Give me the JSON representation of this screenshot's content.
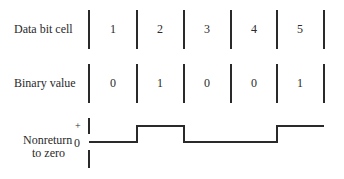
{
  "rows": {
    "data_bit_cell": {
      "label": "Data bit cell",
      "cells": [
        "1",
        "2",
        "3",
        "4",
        "5"
      ]
    },
    "binary_value": {
      "label": "Binary value",
      "values": [
        "0",
        "1",
        "0",
        "0",
        "1"
      ]
    },
    "nrz": {
      "label_line1": "Nonreturn",
      "label_line2": "to zero",
      "plus": "+",
      "zero": "0"
    }
  },
  "colors": {
    "line": "#2a2a2a",
    "text": "#2a2a2a",
    "background": "#ffffff"
  }
}
